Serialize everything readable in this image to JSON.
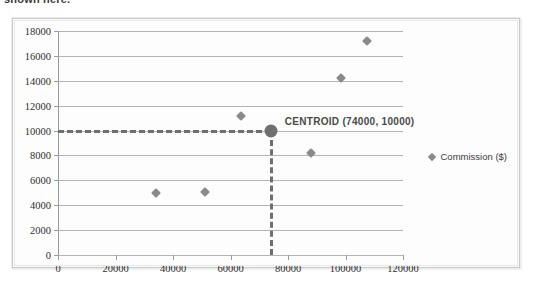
{
  "caption": {
    "text": "shown here."
  },
  "legend": {
    "position": "right",
    "marker": "diamond-marker-icon",
    "entries": [
      {
        "label": "Commission ($)",
        "color": "#8a8a8a"
      }
    ]
  },
  "annotation": {
    "label": "CENTROID (74000, 10000)"
  },
  "chart_data": {
    "type": "scatter",
    "title": "",
    "xlabel": "",
    "ylabel": "",
    "xlim": [
      0,
      120000
    ],
    "ylim": [
      0,
      18000
    ],
    "grid": true,
    "legend_position": "right",
    "xticks": [
      0,
      20000,
      40000,
      60000,
      80000,
      100000,
      120000
    ],
    "yticks": [
      0,
      2000,
      4000,
      6000,
      8000,
      10000,
      12000,
      14000,
      16000,
      18000
    ],
    "xtick_labels": [
      "0",
      "20000",
      "40000",
      "60000",
      "80000",
      "100000",
      "120000"
    ],
    "ytick_labels": [
      "0",
      "2000",
      "4000",
      "6000",
      "8000",
      "10000",
      "12000",
      "14000",
      "16000",
      "18000"
    ],
    "series": [
      {
        "name": "Commission ($)",
        "color": "#8a8a8a",
        "marker": "diamond",
        "points": [
          {
            "x": 34000,
            "y": 5000
          },
          {
            "x": 51000,
            "y": 5100
          },
          {
            "x": 63500,
            "y": 11200
          },
          {
            "x": 88000,
            "y": 8200
          },
          {
            "x": 98500,
            "y": 14200
          },
          {
            "x": 107500,
            "y": 17200
          }
        ]
      }
    ],
    "centroid": {
      "x": 74000,
      "y": 10000,
      "label": "CENTROID (74000, 10000)",
      "color": "#6f6f6f",
      "guides": {
        "horizontal": true,
        "vertical": true,
        "style": "dashed"
      }
    }
  }
}
